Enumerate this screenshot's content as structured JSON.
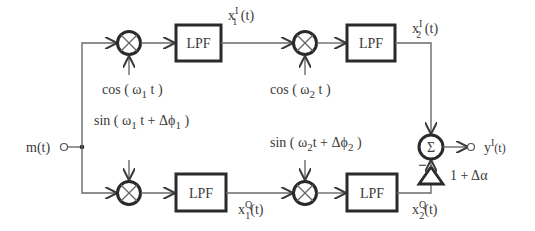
{
  "diagram": {
    "type": "block-diagram",
    "input": {
      "label": "m(t)"
    },
    "output": {
      "label_main": "y",
      "label_sup": "I",
      "label_arg": "(t)"
    },
    "top_branch": {
      "mixer1": {
        "symbol": "×",
        "lo_label": "cos ( ω",
        "lo_sub": "1",
        "lo_tail": " t )"
      },
      "lpf1": {
        "label": "LPF"
      },
      "out1": {
        "main": "x",
        "sup": "I",
        "sub": "1",
        "arg": " (t)"
      },
      "mixer2": {
        "symbol": "×",
        "lo_label": "cos ( ω",
        "lo_sub": "2",
        "lo_tail": " t )"
      },
      "lpf2": {
        "label": "LPF"
      },
      "out2": {
        "main": "x",
        "sup": "I",
        "sub": "2",
        "arg": " (t)"
      }
    },
    "bottom_branch": {
      "mixer1": {
        "symbol": "×",
        "lo_label": "sin ( ω",
        "lo_sub": "1",
        "lo_mid": " t + Δϕ",
        "lo_sub2": "1",
        "lo_tail": " )"
      },
      "lpf1": {
        "label": "LPF"
      },
      "out1": {
        "main": "x",
        "sup": "Q",
        "sub": "1",
        "arg": "(t)"
      },
      "mixer2": {
        "symbol": "×",
        "lo_label": "sin ( ω",
        "lo_sub": "2",
        "lo_mid": "t + Δϕ",
        "lo_sub2": "2",
        "lo_tail": " )"
      },
      "lpf2": {
        "label": "LPF"
      },
      "out2": {
        "main": "x",
        "sup": "Q",
        "sub": "2",
        "arg": "(t)"
      },
      "gain": {
        "label": "1 + Δα"
      }
    },
    "summer": {
      "symbol": "Σ",
      "minus_sign": "−"
    }
  }
}
